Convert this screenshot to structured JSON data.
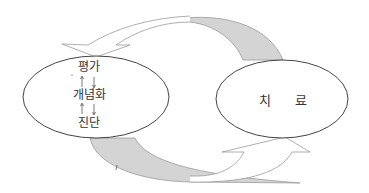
{
  "diagram": {
    "left_node": {
      "items": [
        "평가",
        "개념화",
        "진단"
      ],
      "arrows": [
        "up-down",
        "up-down"
      ]
    },
    "right_node": {
      "label": "치 료"
    },
    "connectors": [
      {
        "from": "right_node",
        "to": "left_node",
        "style": "hollow-curved-arrow",
        "position": "top"
      },
      {
        "from": "left_node",
        "to": "right_node",
        "style": "hollow-curved-arrow",
        "position": "bottom"
      }
    ],
    "colors": {
      "stroke": "#555555",
      "arrow_stroke": "#9a9a9a",
      "band_fill": "#d4d4d4",
      "text": "#333333"
    }
  }
}
